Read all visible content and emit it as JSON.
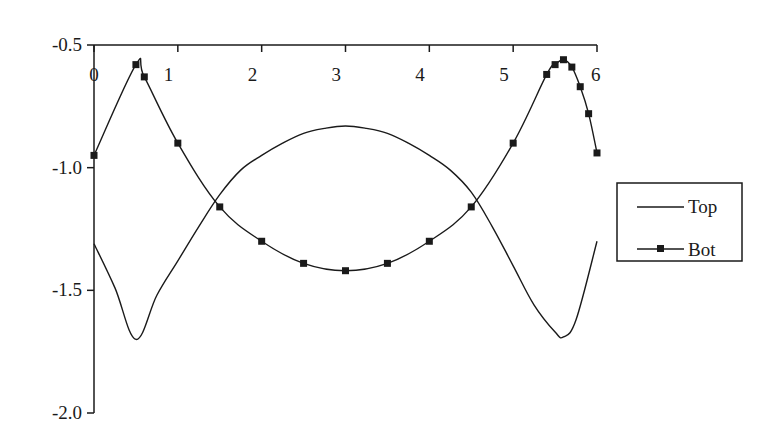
{
  "chart_data": {
    "type": "line",
    "title": "",
    "xlabel": "",
    "ylabel": "",
    "xlim": [
      0,
      6
    ],
    "ylim": [
      -2.0,
      -0.5
    ],
    "grid": false,
    "legend_position": "right",
    "x_ticks": [
      0,
      1,
      2,
      3,
      4,
      5,
      6
    ],
    "x_tick_labels": [
      "0",
      "1",
      "2",
      "3",
      "4",
      "5",
      "6"
    ],
    "x_axis_position": "top",
    "y_ticks": [
      -0.5,
      -1.0,
      -1.5,
      -2.0
    ],
    "y_tick_labels": [
      "-0.5",
      "-1.0",
      "-1.5",
      "-2.0"
    ],
    "series": [
      {
        "name": "Top",
        "marker": "none",
        "x": [
          0,
          0.25,
          0.5,
          0.75,
          1.0,
          1.25,
          1.5,
          1.75,
          2.0,
          2.25,
          2.5,
          2.75,
          3.0,
          3.25,
          3.5,
          3.75,
          4.0,
          4.25,
          4.5,
          4.75,
          5.0,
          5.25,
          5.5,
          5.6,
          5.75,
          6.0
        ],
        "y": [
          -1.31,
          -1.49,
          -1.7,
          -1.52,
          -1.38,
          -1.24,
          -1.11,
          -1.01,
          -0.95,
          -0.9,
          -0.86,
          -0.84,
          -0.83,
          -0.84,
          -0.86,
          -0.9,
          -0.95,
          -1.01,
          -1.1,
          -1.24,
          -1.4,
          -1.56,
          -1.67,
          -1.69,
          -1.62,
          -1.3
        ]
      },
      {
        "name": "Bot",
        "marker": "square",
        "x": [
          0,
          0.5,
          0.6,
          1.0,
          1.5,
          2.0,
          2.5,
          3.0,
          3.5,
          4.0,
          4.5,
          5.0,
          5.4,
          5.5,
          5.6,
          5.7,
          5.8,
          5.9,
          6.0
        ],
        "y": [
          -0.95,
          -0.58,
          -0.63,
          -0.9,
          -1.16,
          -1.3,
          -1.39,
          -1.42,
          -1.39,
          -1.3,
          -1.16,
          -0.9,
          -0.62,
          -0.58,
          -0.56,
          -0.59,
          -0.67,
          -0.78,
          -0.94
        ]
      }
    ]
  },
  "legend": {
    "items": [
      {
        "label": "Top"
      },
      {
        "label": "Bot"
      }
    ]
  }
}
